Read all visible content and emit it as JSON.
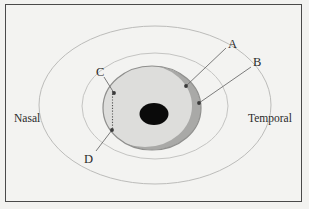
{
  "figure": {
    "background_color": "#f3f3f1",
    "frame_color": "#4a4a4a"
  },
  "orientation_labels": {
    "left": "Nasal",
    "right": "Temporal"
  },
  "part_labels": [
    {
      "key": "A",
      "text": "A"
    },
    {
      "key": "B",
      "text": "B"
    },
    {
      "key": "C",
      "text": "C"
    },
    {
      "key": "D",
      "text": "D"
    }
  ],
  "shapes": {
    "outer_ellipse": {
      "name": "orbit-outline",
      "cx": 155,
      "cy": 105,
      "rx": 116,
      "ry": 79,
      "stroke": "#b9b9b7",
      "fill": "none"
    },
    "eyeball_ellipse": {
      "name": "eyeball-outline",
      "cx": 155,
      "cy": 106,
      "rx": 73,
      "ry": 53,
      "stroke": "#c2c2c0",
      "fill": "none"
    },
    "iris_disc": {
      "name": "iris-disc",
      "cx": 152,
      "cy": 108,
      "rx": 49,
      "ry": 42,
      "fill": "#dcdcda",
      "stroke": "#8e8e8c"
    },
    "limbus_crescent": {
      "name": "limbus-crescent",
      "fill": "#a8a8a6"
    },
    "pupil": {
      "name": "pupil",
      "cx": 154,
      "cy": 114,
      "rx": 14,
      "ry": 11,
      "fill": "#090909"
    },
    "cornea_arc": {
      "name": "cornea-arc",
      "stroke": "#a0a0a0"
    },
    "dotted_line": {
      "name": "corneal-dotted-line",
      "x": 112,
      "y1": 91,
      "y2": 131,
      "stroke": "#4f4f4f"
    }
  },
  "leader_lines": [
    {
      "name": "leader-a",
      "from_label": "A",
      "x1": 227,
      "y1": 48,
      "x2": 185,
      "y2": 86
    },
    {
      "name": "leader-b",
      "from_label": "B",
      "x1": 252,
      "y1": 66,
      "x2": 198,
      "y2": 103
    },
    {
      "name": "leader-c",
      "from_label": "C",
      "x1": 104,
      "y1": 77,
      "x2": 114,
      "y2": 93
    },
    {
      "name": "leader-d",
      "from_label": "D",
      "x1": 95,
      "y1": 152,
      "x2": 112,
      "y2": 130
    }
  ],
  "colors": {
    "page_background": "#f3f3f1",
    "frame": "#4a4a4a",
    "iris_fill": "#dcdcda",
    "crescent_fill": "#a8a8a6",
    "pupil_fill": "#090909",
    "text": "#2a2a2a",
    "leader_stroke": "#6b6b6b"
  }
}
